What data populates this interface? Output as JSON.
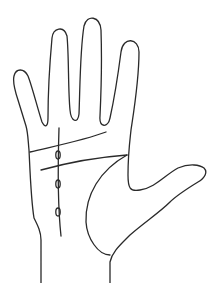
{
  "diagram": {
    "type": "palm-line-drawing",
    "background": "#ffffff",
    "stroke_color": "#2a2a2a",
    "stroke_width": 1.3,
    "parts": {
      "hand_outline": "hand-outline",
      "heart_line": "heart-line",
      "head_line": "head-line",
      "life_line": "life-line",
      "fate_line": "fate-line",
      "islands": [
        {
          "cx": 58,
          "cy": 155,
          "rx": 2.2,
          "ry": 4
        },
        {
          "cx": 58,
          "cy": 184,
          "rx": 2.2,
          "ry": 4
        },
        {
          "cx": 58,
          "cy": 212,
          "rx": 2.2,
          "ry": 4
        }
      ]
    }
  }
}
